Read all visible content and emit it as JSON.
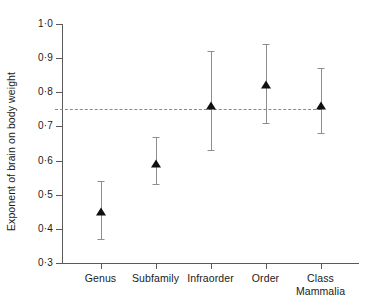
{
  "chart_data": {
    "type": "scatter",
    "title": "",
    "subtitle": "",
    "xlabel": "",
    "ylabel": "Exponent of brain on body weight",
    "categories": [
      "Genus",
      "Subfamily",
      "Infraorder",
      "Order",
      "Class\nMammalia"
    ],
    "series": [
      {
        "name": "Exponent of brain on body weight",
        "values": [
          0.45,
          0.59,
          0.76,
          0.82,
          0.76
        ],
        "error_low": [
          0.37,
          0.53,
          0.63,
          0.71,
          0.68
        ],
        "error_high": [
          0.54,
          0.67,
          0.92,
          0.94,
          0.87
        ],
        "marker": "filled-triangle",
        "marker_color": "#101010"
      }
    ],
    "ylim": [
      0.3,
      1.0
    ],
    "yticks": [
      1.0,
      0.9,
      0.8,
      0.7,
      0.6,
      0.5,
      0.4,
      0.3
    ],
    "ytick_labels": [
      "1·0",
      "0·9",
      "0·8",
      "0·7",
      "0·6",
      "0·5",
      "0·4",
      "0·3"
    ],
    "grid": false,
    "legend": false,
    "legend_position": "none",
    "annotations": [
      {
        "name": "reference-line",
        "type": "hline",
        "value": 0.75,
        "style": "dashed",
        "color": "#8a8a8a"
      }
    ],
    "axis_color": "#5a5a5a",
    "whisker_color": "#8e8e8e",
    "background": "#ffffff"
  }
}
